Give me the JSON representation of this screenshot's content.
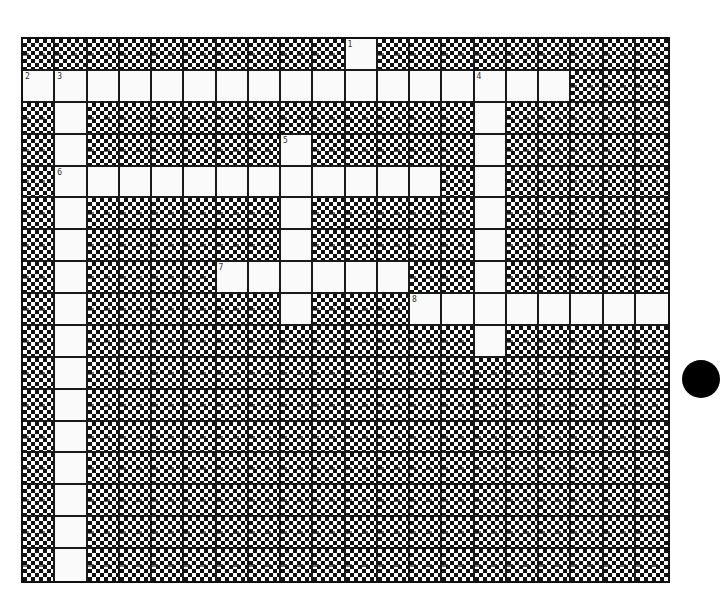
{
  "puzzle": {
    "type": "crossword",
    "rows": 17,
    "cols": 20,
    "colors": {
      "block": "#111111",
      "open": "#fafafa",
      "grid_line": "#1a1a1a"
    },
    "open_cells": [
      [
        0,
        10
      ],
      [
        1,
        0
      ],
      [
        1,
        1
      ],
      [
        1,
        2
      ],
      [
        1,
        3
      ],
      [
        1,
        4
      ],
      [
        1,
        5
      ],
      [
        1,
        6
      ],
      [
        1,
        7
      ],
      [
        1,
        8
      ],
      [
        1,
        9
      ],
      [
        1,
        10
      ],
      [
        1,
        11
      ],
      [
        1,
        12
      ],
      [
        1,
        13
      ],
      [
        1,
        14
      ],
      [
        1,
        15
      ],
      [
        1,
        16
      ],
      [
        2,
        1
      ],
      [
        2,
        14
      ],
      [
        3,
        1
      ],
      [
        3,
        8
      ],
      [
        3,
        14
      ],
      [
        4,
        1
      ],
      [
        4,
        2
      ],
      [
        4,
        3
      ],
      [
        4,
        4
      ],
      [
        4,
        5
      ],
      [
        4,
        6
      ],
      [
        4,
        7
      ],
      [
        4,
        8
      ],
      [
        4,
        9
      ],
      [
        4,
        10
      ],
      [
        4,
        11
      ],
      [
        4,
        12
      ],
      [
        4,
        14
      ],
      [
        5,
        1
      ],
      [
        5,
        8
      ],
      [
        5,
        14
      ],
      [
        6,
        1
      ],
      [
        6,
        8
      ],
      [
        6,
        14
      ],
      [
        7,
        1
      ],
      [
        7,
        6
      ],
      [
        7,
        7
      ],
      [
        7,
        8
      ],
      [
        7,
        9
      ],
      [
        7,
        10
      ],
      [
        7,
        11
      ],
      [
        7,
        14
      ],
      [
        8,
        1
      ],
      [
        8,
        8
      ],
      [
        8,
        12
      ],
      [
        8,
        13
      ],
      [
        8,
        14
      ],
      [
        8,
        15
      ],
      [
        8,
        16
      ],
      [
        8,
        17
      ],
      [
        8,
        18
      ],
      [
        8,
        19
      ],
      [
        9,
        1
      ],
      [
        9,
        14
      ],
      [
        10,
        1
      ],
      [
        11,
        1
      ],
      [
        12,
        1
      ],
      [
        13,
        1
      ],
      [
        14,
        1
      ],
      [
        15,
        1
      ],
      [
        16,
        1
      ]
    ],
    "numbers": [
      {
        "label": "1",
        "row": 0,
        "col": 10
      },
      {
        "label": "2",
        "row": 1,
        "col": 0
      },
      {
        "label": "3",
        "row": 1,
        "col": 1
      },
      {
        "label": "4",
        "row": 1,
        "col": 14
      },
      {
        "label": "5",
        "row": 3,
        "col": 8
      },
      {
        "label": "6",
        "row": 4,
        "col": 1
      },
      {
        "label": "7",
        "row": 7,
        "col": 6
      },
      {
        "label": "8",
        "row": 8,
        "col": 12
      }
    ],
    "entries": {
      "across": [
        {
          "number": "2",
          "row": 1,
          "col": 0,
          "length": 17
        },
        {
          "number": "6",
          "row": 4,
          "col": 1,
          "length": 12
        },
        {
          "number": "7",
          "row": 7,
          "col": 6,
          "length": 6
        },
        {
          "number": "8",
          "row": 8,
          "col": 12,
          "length": 8
        }
      ],
      "down": [
        {
          "number": "1",
          "row": 0,
          "col": 10,
          "length": 2
        },
        {
          "number": "3",
          "row": 1,
          "col": 1,
          "length": 16
        },
        {
          "number": "4",
          "row": 1,
          "col": 14,
          "length": 9
        },
        {
          "number": "5",
          "row": 3,
          "col": 8,
          "length": 6
        }
      ]
    }
  },
  "decorations": {
    "punch_hole": {
      "visible": true,
      "color": "#000000"
    }
  }
}
